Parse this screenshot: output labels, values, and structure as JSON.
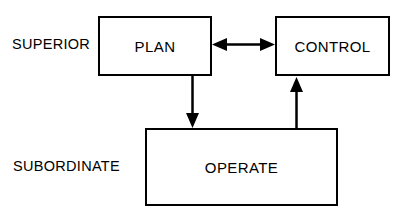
{
  "diagram": {
    "background_color": "#ffffff",
    "line_color": "#000000",
    "tiers": [
      {
        "id": "superior",
        "label": "SUPERIOR"
      },
      {
        "id": "subordinate",
        "label": "SUBORDINATE"
      }
    ],
    "nodes": [
      {
        "id": "plan",
        "label": "PLAN",
        "tier": "superior"
      },
      {
        "id": "control",
        "label": "CONTROL",
        "tier": "superior"
      },
      {
        "id": "operate",
        "label": "OPERATE",
        "tier": "subordinate"
      }
    ],
    "connectors": [
      {
        "id": "plan-control",
        "from": "plan",
        "to": "control",
        "style": "double-headed-arrow",
        "orientation": "horizontal"
      },
      {
        "id": "plan-operate",
        "from": "plan",
        "to": "operate",
        "style": "single-headed-arrow",
        "orientation": "vertical-down"
      },
      {
        "id": "operate-control",
        "from": "operate",
        "to": "control",
        "style": "single-headed-arrow",
        "orientation": "vertical-up"
      }
    ]
  }
}
